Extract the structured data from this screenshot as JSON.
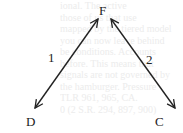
{
  "diagram": {
    "nodes": [
      {
        "id": "F",
        "label": "F"
      },
      {
        "id": "D",
        "label": "D"
      },
      {
        "id": "C",
        "label": "C"
      }
    ],
    "edges": [
      {
        "from": "F",
        "to": "D",
        "label": "1",
        "bidirectional": true
      },
      {
        "from": "F",
        "to": "C",
        "label": "2",
        "bidirectional": true
      }
    ],
    "colors": {
      "line": "#222222",
      "bleed_text": "#ececec"
    }
  },
  "bleed_through_lines": [
    "ional. The active",
    "those of us that use",
    "mapped by the tiered model",
    "you can now leave behind",
    "be conditions. Accounts",
    "before. This means that",
    "signals are not governed by",
    "the hamburger. Pressure",
    "TLR 961, 965, CA.",
    "0 (2 S.R. 294, 897, 900)"
  ]
}
